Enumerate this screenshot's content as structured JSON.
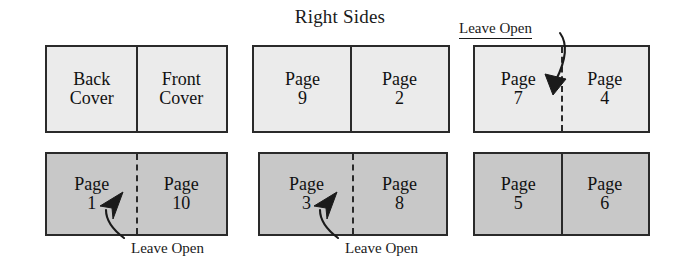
{
  "title": "Right Sides",
  "colors": {
    "row1_fill": "#ebebeb",
    "row2_fill": "#c8c8c8",
    "stroke": "#2a2a2a",
    "text": "#111111",
    "background": "#ffffff"
  },
  "diagram": {
    "type": "imposition-layout",
    "rows": [
      {
        "name": "row-1",
        "fill": "#ebebeb",
        "spreads": [
          {
            "id": "spread-back-front-cover",
            "divider": "solid",
            "left": {
              "line1": "Back",
              "line2": "Cover"
            },
            "right": {
              "line1": "Front",
              "line2": "Cover"
            }
          },
          {
            "id": "spread-9-2",
            "divider": "solid",
            "left": {
              "line1": "Page",
              "line2": "9"
            },
            "right": {
              "line1": "Page",
              "line2": "2"
            }
          },
          {
            "id": "spread-7-4",
            "divider": "dashed",
            "left": {
              "line1": "Page",
              "line2": "7"
            },
            "right": {
              "line1": "Page",
              "line2": "4"
            },
            "callout": "Leave Open"
          }
        ]
      },
      {
        "name": "row-2",
        "fill": "#c8c8c8",
        "spreads": [
          {
            "id": "spread-1-10",
            "divider": "dashed",
            "left": {
              "line1": "Page",
              "line2": "1"
            },
            "right": {
              "line1": "Page",
              "line2": "10"
            },
            "callout": "Leave Open"
          },
          {
            "id": "spread-3-8",
            "divider": "dashed",
            "left": {
              "line1": "Page",
              "line2": "3"
            },
            "right": {
              "line1": "Page",
              "line2": "8"
            },
            "callout": "Leave Open"
          },
          {
            "id": "spread-5-6",
            "divider": "solid",
            "left": {
              "line1": "Page",
              "line2": "5"
            },
            "right": {
              "line1": "Page",
              "line2": "6"
            }
          }
        ]
      }
    ]
  }
}
